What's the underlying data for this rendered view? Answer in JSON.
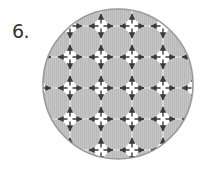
{
  "figure": {
    "number_label": "6.",
    "grid": {
      "gap_columns": 5,
      "gap_rows": 5,
      "arrow_directions": [
        "up",
        "down",
        "left",
        "right"
      ]
    },
    "colors": {
      "disc": "#c6c6c6",
      "disc_stripe": "#b9b9b9",
      "arrow": "#3a3a3a",
      "outline": "#9a9a9a",
      "background": "#ffffff"
    }
  }
}
